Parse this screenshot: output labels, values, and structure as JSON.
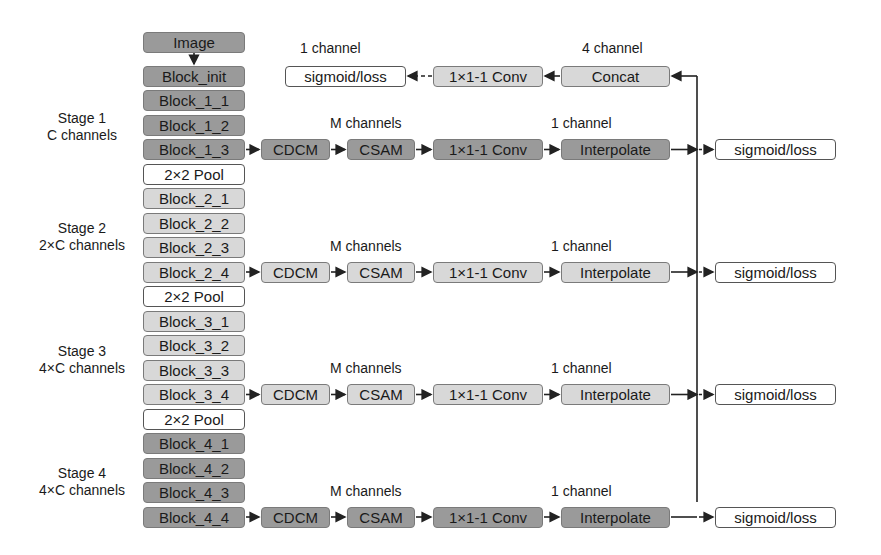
{
  "colors": {
    "dark_block": "#9a9a9a",
    "light_block": "#d8d8d8",
    "white_block": "#ffffff",
    "line": "#222222"
  },
  "backbone": {
    "input": "Image",
    "init": "Block_init",
    "pool": "2×2 Pool",
    "stages": [
      {
        "title": "Stage 1",
        "channels": "C channels",
        "blocks": [
          "Block_1_1",
          "Block_1_2",
          "Block_1_3"
        ],
        "shade": "dark"
      },
      {
        "title": "Stage 2",
        "channels": "2×C channels",
        "blocks": [
          "Block_2_1",
          "Block_2_2",
          "Block_2_3",
          "Block_2_4"
        ],
        "shade": "light"
      },
      {
        "title": "Stage 3",
        "channels": "4×C channels",
        "blocks": [
          "Block_3_1",
          "Block_3_2",
          "Block_3_3",
          "Block_3_4"
        ],
        "shade": "light"
      },
      {
        "title": "Stage 4",
        "channels": "4×C channels",
        "blocks": [
          "Block_4_1",
          "Block_4_2",
          "Block_4_3",
          "Block_4_4"
        ],
        "shade": "dark"
      }
    ]
  },
  "side_branch": {
    "modules": [
      "CDCM",
      "CSAM",
      "1×1-1 Conv",
      "Interpolate"
    ],
    "mid_label": "M channels",
    "out_label": "1 channel",
    "output": "sigmoid/loss"
  },
  "fusion": {
    "concat": "Concat",
    "concat_label": "4 channel",
    "conv": "1×1-1 Conv",
    "output": "sigmoid/loss",
    "output_label": "1 channel"
  }
}
